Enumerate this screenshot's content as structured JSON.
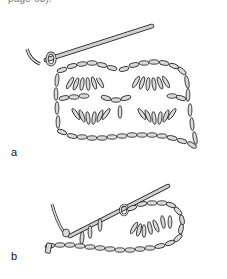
{
  "caption": {
    "text": "page 63)."
  },
  "figures": [
    {
      "label": "a",
      "description": "Crochet fabric with hook inserted, two rows of shell/fan stitches"
    },
    {
      "label": "b",
      "description": "Foundation chain with first fan stitch and hook"
    }
  ],
  "colors": {
    "yarn_fill": "#d9d9d9",
    "outline": "#1a1a1a",
    "hook": "#cfcfcf",
    "background": "#ffffff"
  }
}
